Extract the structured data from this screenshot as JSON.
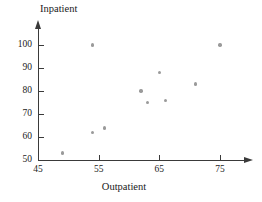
{
  "chart_data": {
    "type": "scatter",
    "title": "",
    "xlabel": "Outpatient",
    "ylabel": "Inpatient",
    "xlim": [
      45,
      78
    ],
    "ylim": [
      50,
      103
    ],
    "xticks": [
      45,
      55,
      65,
      75
    ],
    "yticks": [
      50,
      60,
      70,
      80,
      90,
      100
    ],
    "grid": false,
    "legend": null,
    "marker_color": "#9a9a9a",
    "axis_color": "#3a3a3a",
    "points": [
      {
        "x": 49,
        "y": 53
      },
      {
        "x": 54,
        "y": 62
      },
      {
        "x": 54,
        "y": 100
      },
      {
        "x": 56,
        "y": 64
      },
      {
        "x": 62,
        "y": 80
      },
      {
        "x": 63,
        "y": 75
      },
      {
        "x": 65,
        "y": 88
      },
      {
        "x": 66,
        "y": 76
      },
      {
        "x": 71,
        "y": 83
      },
      {
        "x": 75,
        "y": 100
      }
    ]
  }
}
